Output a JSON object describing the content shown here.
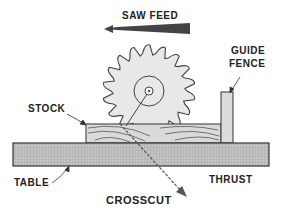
{
  "diagram": {
    "title": "CROSSCUT",
    "labels": {
      "saw_feed": "SAW FEED",
      "guide_fence_line1": "GUIDE",
      "guide_fence_line2": "FENCE",
      "stock": "STOCK",
      "table": "TABLE",
      "thrust": "THRUST"
    },
    "components": [
      "saw-blade",
      "stock",
      "guide-fence",
      "table",
      "saw-feed-arrow",
      "thrust-arrow"
    ],
    "colors": {
      "ink": "#222222",
      "blade_fill": "#e6e6e6",
      "table_fill": "#bdbdbd",
      "stock_fill": "#d8d8d8",
      "fence_fill": "#dcdcdc"
    }
  }
}
